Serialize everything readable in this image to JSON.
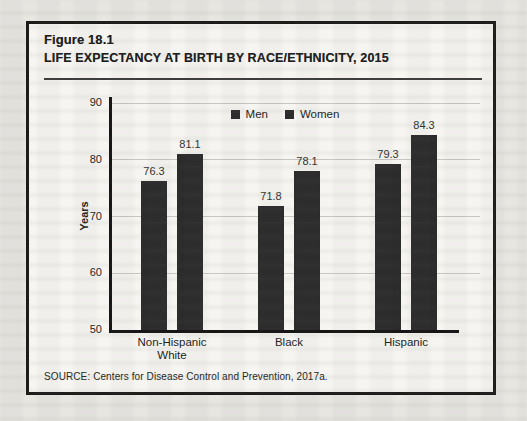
{
  "figure": {
    "label": "Figure 18.1",
    "title": "LIFE EXPECTANCY AT BIRTH BY RACE/ETHNICITY, 2015",
    "source": "SOURCE: Centers for Disease Control and Prevention, 2017a."
  },
  "chart_data": {
    "type": "bar",
    "title": "LIFE EXPECTANCY AT BIRTH BY RACE/ETHNICITY, 2015",
    "categories": [
      "Non-Hispanic\nWhite",
      "Black",
      "Hispanic"
    ],
    "series": [
      {
        "name": "Men",
        "values": [
          76.3,
          71.8,
          79.3
        ]
      },
      {
        "name": "Women",
        "values": [
          81.1,
          78.1,
          84.3
        ]
      }
    ],
    "xlabel": "",
    "ylabel": "Years",
    "ylim": [
      50,
      90
    ],
    "yticks": [
      90,
      80,
      70,
      60,
      50
    ],
    "grid": true,
    "legend": [
      "Men",
      "Women"
    ],
    "legend_position": "top-center",
    "bar_color": "#2c2c2c"
  },
  "colors": {
    "page_background": "#e8e6e1",
    "figure_background": "#f6f5f1",
    "border": "#1d1c1a",
    "bar": "#2c2c2c",
    "gridline": "#c7c6c2",
    "axis": "#161616"
  }
}
